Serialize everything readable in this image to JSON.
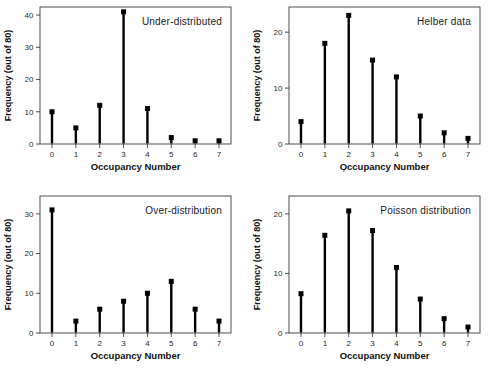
{
  "figure": {
    "background": "#ffffff",
    "stem_color": "#000000",
    "frame_color": "#3a3a3a",
    "text_color": "#1f1f1f"
  },
  "chart_data": [
    {
      "type": "stem",
      "panel": "top-left",
      "title": "Under-distributed",
      "xlabel": "Occupancy Number",
      "ylabel": "Frequency (out of 80)",
      "categories": [
        0,
        1,
        2,
        3,
        4,
        5,
        6,
        7
      ],
      "values": [
        10,
        5,
        12,
        41,
        11,
        2,
        1,
        1
      ],
      "yticks": [
        0,
        10,
        20,
        30,
        40
      ],
      "ylim": [
        0,
        42.5
      ],
      "grid": false,
      "legend": false
    },
    {
      "type": "stem",
      "panel": "top-right",
      "title": "Helber data",
      "xlabel": "Occupancy Number",
      "ylabel": "Frequency (out of 80)",
      "categories": [
        0,
        1,
        2,
        3,
        4,
        5,
        6,
        7
      ],
      "values": [
        4,
        18,
        23,
        15,
        12,
        5,
        2,
        1
      ],
      "yticks": [
        0,
        10,
        20
      ],
      "ylim": [
        0,
        24.5
      ],
      "grid": false,
      "legend": false
    },
    {
      "type": "stem",
      "panel": "bottom-left",
      "title": "Over-distribution",
      "xlabel": "Occupancy Number",
      "ylabel": "Frequency (out of 80)",
      "categories": [
        0,
        1,
        2,
        3,
        4,
        5,
        6,
        7
      ],
      "values": [
        31,
        3,
        6,
        8,
        10,
        13,
        6,
        3
      ],
      "yticks": [
        0,
        10,
        20,
        30
      ],
      "ylim": [
        0,
        34.5
      ],
      "grid": false,
      "legend": false
    },
    {
      "type": "stem",
      "panel": "bottom-right",
      "title": "Poisson distribution",
      "xlabel": "Occupancy Number",
      "ylabel": "Frequency (out of 80)",
      "categories": [
        0,
        1,
        2,
        3,
        4,
        5,
        6,
        7
      ],
      "values": [
        6.6,
        16.4,
        20.5,
        17.2,
        11,
        5.7,
        2.4,
        1
      ],
      "yticks": [
        0,
        10,
        20
      ],
      "ylim": [
        0,
        23
      ],
      "grid": false,
      "legend": false
    }
  ]
}
